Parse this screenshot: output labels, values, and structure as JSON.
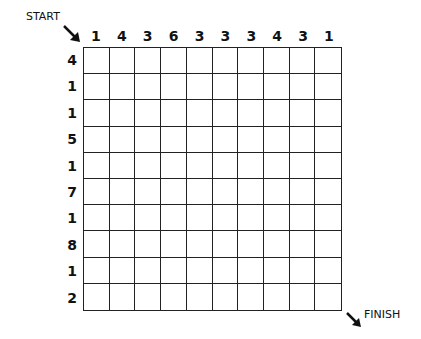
{
  "puzzle": {
    "start_label": "START",
    "finish_label": "FINISH",
    "column_clues": [
      "1",
      "4",
      "3",
      "6",
      "3",
      "3",
      "3",
      "4",
      "3",
      "1"
    ],
    "row_clues": [
      "4",
      "1",
      "1",
      "5",
      "1",
      "7",
      "1",
      "8",
      "1",
      "2"
    ],
    "rows": 10,
    "cols": 10
  }
}
